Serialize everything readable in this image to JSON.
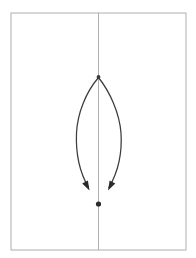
{
  "figure": {
    "background_color": "#ffffff",
    "frame": {
      "name": "figure-border",
      "x": 11,
      "y": 13,
      "width": 175,
      "height": 237,
      "stroke_color": "#b5b5b5",
      "stroke_width": 1.1
    },
    "axis_line": {
      "name": "vertical-axis-line",
      "x": 98.5,
      "y_start": 13,
      "y_end": 250,
      "stroke_color": "#b0b0b0",
      "stroke_width": 1.0
    },
    "vertex": {
      "name": "apex-point",
      "x": 98.5,
      "y": 77,
      "radius": 1.9,
      "color": "#3a3a3a"
    },
    "dot": {
      "name": "focus-dot",
      "x": 98.5,
      "y": 204,
      "radius": 2.6,
      "color": "#2b2b2b"
    },
    "curves": [
      {
        "name": "left-curve",
        "stroke_color": "#3c3c3c",
        "stroke_width": 1.25,
        "path": "M 98.5 77.5 C 86 92 77.5 113 76.5 133 C 75.7 152 79.5 172 88.5 187.5",
        "arrow_tip": {
          "x": 89.5,
          "y": 190.5
        },
        "arrow_angle_deg": 60
      },
      {
        "name": "right-curve",
        "stroke_color": "#3c3c3c",
        "stroke_width": 1.25,
        "path": "M 98.5 77.5 C 110 92 119.5 113 121 133 C 122.2 152 118 172 109 187.5",
        "arrow_tip": {
          "x": 108.0,
          "y": 190.5
        },
        "arrow_angle_deg": 120
      }
    ],
    "arrowheads": [
      {
        "name": "left-arrowhead",
        "tip_x": 89.5,
        "tip_y": 190.5,
        "color": "#2b2b2b",
        "length": 9.5,
        "half_width": 3.2,
        "direction_deg": 62
      },
      {
        "name": "right-arrowhead",
        "tip_x": 108.0,
        "tip_y": 190.5,
        "color": "#2b2b2b",
        "length": 9.5,
        "half_width": 3.2,
        "direction_deg": 118
      }
    ]
  }
}
